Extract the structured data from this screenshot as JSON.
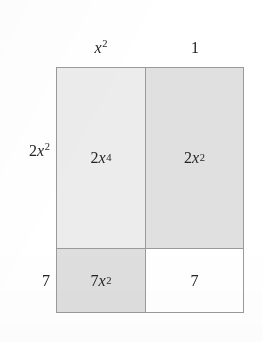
{
  "figure": {
    "type": "area-model-multiplication-grid",
    "colors": {
      "page_background": "#ffffff",
      "border": "#9a9a9a",
      "text": "#242424",
      "cell_fill_light": "#ececec",
      "cell_fill_medium": "#e0e0e0",
      "cell_fill_white": "#ffffff"
    }
  },
  "column_headers": [
    {
      "id": "left",
      "label": "x2",
      "base": "x",
      "exponent": "2",
      "italic": true
    },
    {
      "id": "right",
      "label": "1",
      "base": "1",
      "exponent": "",
      "italic": false
    }
  ],
  "row_labels": [
    {
      "id": "top",
      "coefficient": "2",
      "base": "x",
      "exponent": "2"
    },
    {
      "id": "bottom",
      "coefficient": "7",
      "base": "",
      "exponent": ""
    }
  ],
  "cells": [
    {
      "id": "top-left",
      "row": "top",
      "column": "left",
      "coefficient": "2",
      "base": "x",
      "exponent": "4",
      "plain": "2x4",
      "fill": "#ececec"
    },
    {
      "id": "top-right",
      "row": "top",
      "column": "right",
      "coefficient": "2",
      "base": "x",
      "exponent": "2",
      "plain": "2x2",
      "fill": "#e0e0e0"
    },
    {
      "id": "bottom-left",
      "row": "bottom",
      "column": "left",
      "coefficient": "7",
      "base": "x",
      "exponent": "2",
      "plain": "7x2",
      "fill": "#dedede"
    },
    {
      "id": "bottom-right",
      "row": "bottom",
      "column": "right",
      "coefficient": "7",
      "base": "",
      "exponent": "",
      "plain": "7",
      "fill": "#ffffff"
    }
  ]
}
